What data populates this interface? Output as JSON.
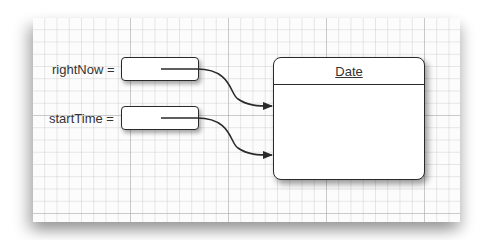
{
  "diagram": {
    "type": "object-reference-diagram",
    "background": "grid-paper",
    "variables": [
      {
        "name": "rightNow",
        "label": "rightNow =",
        "points_to": "Date"
      },
      {
        "name": "startTime",
        "label": "startTime =",
        "points_to": "Date"
      }
    ],
    "objects": [
      {
        "class_name": "Date"
      }
    ],
    "colors": {
      "stroke": "#2a2a2a",
      "text": "#333333",
      "grid_minor": "#d8d8d8",
      "grid_major": "#b0b0b0"
    }
  }
}
